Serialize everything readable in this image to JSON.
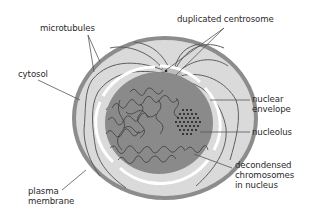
{
  "diagram": {
    "type": "labeled cell cross-section",
    "colors": {
      "plasma_membrane": "#8c8c8c",
      "cytosol": "#dadada",
      "nuclear_envelope": "#ffffff",
      "nucleus": "#8a8a8a",
      "chromatin": "#3a3a3a",
      "nucleolus_dots": "#1a1a1a",
      "microtubules": "#5a5a5a",
      "centrosome": "#bdbdbd",
      "leader_lines": "#555555",
      "label_text": "#2a2a2a"
    },
    "labels": {
      "microtubules": "microtubules",
      "cytosol": "cytosol",
      "plasma_membrane_1": "plasma",
      "plasma_membrane_2": "membrane",
      "duplicated_centrosome": "duplicated centrosome",
      "nuclear_envelope_1": "nuclear",
      "nuclear_envelope_2": "envelope",
      "nucleolus": "nucleolus",
      "chromosomes_1": "decondensed",
      "chromosomes_2": "chromosomes",
      "chromosomes_3": "in nucleus"
    }
  }
}
